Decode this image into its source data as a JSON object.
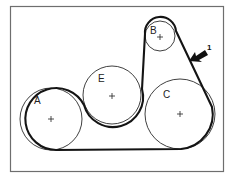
{
  "figure": {
    "type": "serpentine belt routing diagram",
    "pulleys": [
      {
        "id": "A",
        "label": "A"
      },
      {
        "id": "E",
        "label": "E"
      },
      {
        "id": "B",
        "label": "B"
      },
      {
        "id": "C",
        "label": "C"
      }
    ],
    "belt_route": [
      "A",
      "E",
      "B",
      "C"
    ],
    "callouts": [
      {
        "number": "1",
        "points_to": "belt between B and C"
      }
    ]
  }
}
